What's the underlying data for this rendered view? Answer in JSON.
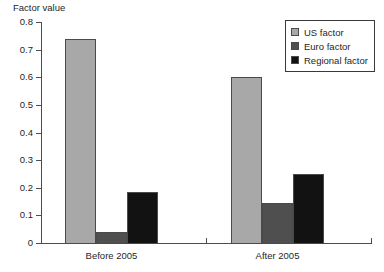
{
  "chart_data": {
    "type": "bar",
    "title": "",
    "ylabel": "Factor value",
    "xlabel": "",
    "ylim": [
      0,
      0.8
    ],
    "yticks": [
      "0",
      "0.1",
      "0.2",
      "0.3",
      "0.4",
      "0.5",
      "0.6",
      "0.7",
      "0.8"
    ],
    "ytick_values": [
      0,
      0.1,
      0.2,
      0.3,
      0.4,
      0.5,
      0.6,
      0.7,
      0.8
    ],
    "categories": [
      "Before 2005",
      "After 2005"
    ],
    "grid": false,
    "legend_position": "top-right",
    "series": [
      {
        "name": "US factor",
        "color": "#a8a8a8",
        "values": [
          0.74,
          0.6
        ]
      },
      {
        "name": "Euro factor",
        "color": "#4f4f4f",
        "values": [
          0.04,
          0.145
        ]
      },
      {
        "name": "Regional factor",
        "color": "#121212",
        "values": [
          0.185,
          0.25
        ]
      }
    ]
  },
  "legend": {
    "items": [
      {
        "label": "US factor"
      },
      {
        "label": "Euro factor"
      },
      {
        "label": "Regional factor"
      }
    ]
  }
}
